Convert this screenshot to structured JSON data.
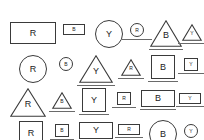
{
  "canvas": {
    "width": 204,
    "height": 140,
    "background": "#ffffff",
    "stroke_color": "#3a3a3a",
    "underline_color": "#6a6a6a",
    "text_color": "#222222"
  },
  "legend": {
    "letters": [
      "R",
      "B",
      "Y"
    ],
    "shapes": [
      "rect",
      "square",
      "circle",
      "triangle"
    ]
  },
  "chart_data": {
    "type": "table",
    "title": "",
    "rows": 4,
    "columns": 6,
    "items": [
      {
        "row": 0,
        "col": 0,
        "shape": "rect",
        "letter": "R",
        "w": 46,
        "h": 22,
        "font": 9,
        "underline": false,
        "underline_w": 0,
        "cx": 33,
        "cy": 22
      },
      {
        "row": 0,
        "col": 1,
        "shape": "rect",
        "letter": "B",
        "w": 22,
        "h": 11,
        "font": 5,
        "underline": false,
        "underline_w": 0,
        "cx": 74,
        "cy": 24
      },
      {
        "row": 0,
        "col": 2,
        "shape": "circle",
        "letter": "Y",
        "w": 28,
        "h": 28,
        "font": 9,
        "underline": false,
        "underline_w": 0,
        "cx": 109,
        "cy": 20
      },
      {
        "row": 0,
        "col": 3,
        "shape": "circle",
        "letter": "R",
        "w": 14,
        "h": 14,
        "font": 5,
        "underline": true,
        "underline_w": 30,
        "cx": 137,
        "cy": 23
      },
      {
        "row": 0,
        "col": 4,
        "shape": "triangle",
        "letter": "B",
        "w": 32,
        "h": 27,
        "font": 9,
        "underline": true,
        "underline_w": 34,
        "cx": 166,
        "cy": 20
      },
      {
        "row": 0,
        "col": 5,
        "shape": "triangle",
        "letter": "Y",
        "w": 20,
        "h": 17,
        "font": 5,
        "underline": true,
        "underline_w": 28,
        "cx": 192,
        "cy": 24
      },
      {
        "row": 1,
        "col": 0,
        "shape": "circle",
        "letter": "R",
        "w": 28,
        "h": 28,
        "font": 9,
        "underline": false,
        "underline_w": 0,
        "cx": 33,
        "cy": 55
      },
      {
        "row": 1,
        "col": 1,
        "shape": "circle",
        "letter": "B",
        "w": 14,
        "h": 14,
        "font": 5,
        "underline": false,
        "underline_w": 0,
        "cx": 66,
        "cy": 57
      },
      {
        "row": 1,
        "col": 2,
        "shape": "triangle",
        "letter": "Y",
        "w": 34,
        "h": 28,
        "font": 9,
        "underline": true,
        "underline_w": 38,
        "cx": 96,
        "cy": 55
      },
      {
        "row": 1,
        "col": 3,
        "shape": "triangle",
        "letter": "R",
        "w": 20,
        "h": 17,
        "font": 5,
        "underline": true,
        "underline_w": 26,
        "cx": 131,
        "cy": 59
      },
      {
        "row": 1,
        "col": 4,
        "shape": "square",
        "letter": "B",
        "w": 24,
        "h": 24,
        "font": 9,
        "underline": true,
        "underline_w": 30,
        "cx": 163,
        "cy": 55
      },
      {
        "row": 1,
        "col": 5,
        "shape": "square",
        "letter": "Y",
        "w": 14,
        "h": 13,
        "font": 5,
        "underline": true,
        "underline_w": 26,
        "cx": 191,
        "cy": 58
      },
      {
        "row": 2,
        "col": 0,
        "shape": "triangle",
        "letter": "R",
        "w": 36,
        "h": 29,
        "font": 9,
        "underline": false,
        "underline_w": 0,
        "cx": 28,
        "cy": 88
      },
      {
        "row": 2,
        "col": 1,
        "shape": "triangle",
        "letter": "B",
        "w": 20,
        "h": 17,
        "font": 5,
        "underline": true,
        "underline_w": 26,
        "cx": 62,
        "cy": 92
      },
      {
        "row": 2,
        "col": 2,
        "shape": "square",
        "letter": "Y",
        "w": 24,
        "h": 24,
        "font": 9,
        "underline": true,
        "underline_w": 30,
        "cx": 94,
        "cy": 88
      },
      {
        "row": 2,
        "col": 3,
        "shape": "square",
        "letter": "R",
        "w": 14,
        "h": 13,
        "font": 5,
        "underline": true,
        "underline_w": 24,
        "cx": 124,
        "cy": 92
      },
      {
        "row": 2,
        "col": 4,
        "shape": "rect",
        "letter": "B",
        "w": 34,
        "h": 17,
        "font": 9,
        "underline": true,
        "underline_w": 36,
        "cx": 158,
        "cy": 90
      },
      {
        "row": 2,
        "col": 5,
        "shape": "rect",
        "letter": "Y",
        "w": 22,
        "h": 11,
        "font": 5,
        "underline": true,
        "underline_w": 28,
        "cx": 190,
        "cy": 93
      },
      {
        "row": 3,
        "col": 0,
        "shape": "square",
        "letter": "R",
        "w": 24,
        "h": 24,
        "font": 9,
        "underline": true,
        "underline_w": 30,
        "cx": 31,
        "cy": 121
      },
      {
        "row": 3,
        "col": 1,
        "shape": "square",
        "letter": "B",
        "w": 14,
        "h": 13,
        "font": 5,
        "underline": true,
        "underline_w": 24,
        "cx": 62,
        "cy": 124
      },
      {
        "row": 3,
        "col": 2,
        "shape": "rect",
        "letter": "Y",
        "w": 34,
        "h": 17,
        "font": 9,
        "underline": true,
        "underline_w": 38,
        "cx": 96,
        "cy": 122
      },
      {
        "row": 3,
        "col": 3,
        "shape": "rect",
        "letter": "R",
        "w": 22,
        "h": 11,
        "font": 5,
        "underline": true,
        "underline_w": 28,
        "cx": 129,
        "cy": 124
      },
      {
        "row": 3,
        "col": 4,
        "shape": "circle",
        "letter": "B",
        "w": 28,
        "h": 28,
        "font": 9,
        "underline": false,
        "underline_w": 0,
        "cx": 163,
        "cy": 120
      },
      {
        "row": 3,
        "col": 5,
        "shape": "circle",
        "letter": "Y",
        "w": 14,
        "h": 14,
        "font": 5,
        "underline": false,
        "underline_w": 0,
        "cx": 191,
        "cy": 124
      }
    ]
  }
}
